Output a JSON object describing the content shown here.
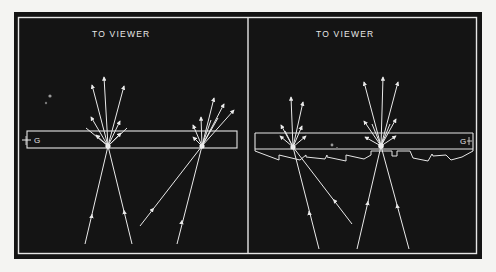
{
  "figure": {
    "background": "#f4f4f2",
    "frame_color": "#141414",
    "line_color": "#e8e8e8",
    "panels": [
      {
        "id": "left",
        "title": "TO VIEWER",
        "plate_label": "G",
        "plate_type": "flat glass plate",
        "stars": [
          {
            "x": 108,
            "y": 146,
            "incident_rays": 2,
            "emergent_rays": 9
          },
          {
            "x": 202,
            "y": 146,
            "incident_rays": 2,
            "emergent_rays": 8
          }
        ]
      },
      {
        "id": "right",
        "title": "TO VIEWER",
        "plate_label": "G",
        "plate_type": "glass plate with sawtooth (prismatic) underside",
        "stars": [
          {
            "x": 293,
            "y": 147,
            "incident_rays": 2,
            "emergent_rays": 7
          },
          {
            "x": 381,
            "y": 146,
            "incident_rays": 2,
            "emergent_rays": 9
          }
        ]
      }
    ]
  }
}
